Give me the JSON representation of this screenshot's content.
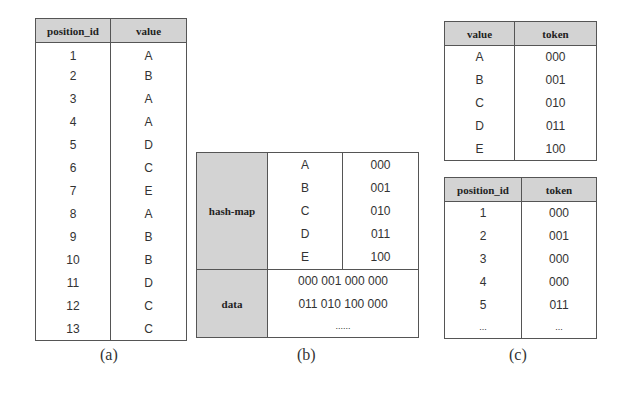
{
  "table_a": {
    "headers": [
      "position_id",
      "value"
    ],
    "rows": [
      [
        "1",
        "A"
      ],
      [
        "2",
        "B"
      ],
      [
        "3",
        "A"
      ],
      [
        "4",
        "A"
      ],
      [
        "5",
        "D"
      ],
      [
        "6",
        "C"
      ],
      [
        "7",
        "E"
      ],
      [
        "8",
        "A"
      ],
      [
        "9",
        "B"
      ],
      [
        "10",
        "B"
      ],
      [
        "11",
        "D"
      ],
      [
        "12",
        "C"
      ],
      [
        "13",
        "C"
      ]
    ],
    "caption": "(a)"
  },
  "table_b": {
    "hashmap_label": "hash-map",
    "hashmap_rows": [
      [
        "A",
        "000"
      ],
      [
        "B",
        "001"
      ],
      [
        "C",
        "010"
      ],
      [
        "D",
        "011"
      ],
      [
        "E",
        "100"
      ]
    ],
    "data_label": "data",
    "data_lines": [
      "000 001 000 000",
      "011 010 100 000",
      "......"
    ],
    "caption": "(b)"
  },
  "table_c_top": {
    "headers": [
      "value",
      "token"
    ],
    "rows": [
      [
        "A",
        "000"
      ],
      [
        "B",
        "001"
      ],
      [
        "C",
        "010"
      ],
      [
        "D",
        "011"
      ],
      [
        "E",
        "100"
      ]
    ]
  },
  "table_c_bottom": {
    "headers": [
      "position_id",
      "token"
    ],
    "rows": [
      [
        "1",
        "000"
      ],
      [
        "2",
        "001"
      ],
      [
        "3",
        "000"
      ],
      [
        "4",
        "000"
      ],
      [
        "5",
        "011"
      ],
      [
        "...",
        "..."
      ]
    ]
  },
  "caption_c": "(c)",
  "colors": {
    "header_bg": "#d3d3d3",
    "border": "#555555"
  }
}
